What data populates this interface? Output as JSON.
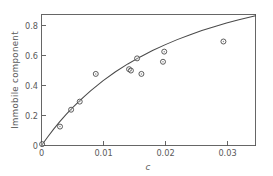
{
  "chart_data": {
    "type": "scatter",
    "title": "",
    "xlabel": "c",
    "ylabel": "Immobile component",
    "xlim": [
      0,
      0.0347
    ],
    "ylim": [
      0,
      0.97
    ],
    "grid": false,
    "legend": null,
    "x_ticks": [
      0,
      0.01,
      0.02,
      0.03
    ],
    "x_tick_labels": [
      "0",
      "0.01",
      "0.02",
      "0.03"
    ],
    "y_ticks": [
      0,
      0.2,
      0.4,
      0.6,
      0.8
    ],
    "y_tick_labels": [
      "0",
      "0.2",
      "0.4",
      "0.6",
      "0.8"
    ],
    "series": [
      {
        "name": "Immobile component data",
        "marker": "open-circle",
        "x": [
          0.0001,
          0.003,
          0.0048,
          0.0062,
          0.0088,
          0.0142,
          0.0145,
          0.0155,
          0.0162,
          0.0197,
          0.0199,
          0.0295
        ],
        "values": [
          0.01,
          0.14,
          0.265,
          0.325,
          0.53,
          0.565,
          0.555,
          0.645,
          0.53,
          0.62,
          0.695,
          0.77
        ]
      },
      {
        "name": "Fitted curve",
        "type": "line",
        "x": [
          0.0,
          0.001,
          0.002,
          0.003,
          0.004,
          0.005,
          0.006,
          0.007,
          0.008,
          0.009,
          0.01,
          0.012,
          0.014,
          0.016,
          0.018,
          0.02,
          0.022,
          0.024,
          0.026,
          0.028,
          0.03,
          0.032,
          0.0347
        ],
        "values": [
          0.0,
          0.063,
          0.123,
          0.178,
          0.23,
          0.278,
          0.323,
          0.366,
          0.406,
          0.444,
          0.48,
          0.546,
          0.604,
          0.656,
          0.703,
          0.745,
          0.784,
          0.819,
          0.851,
          0.88,
          0.907,
          0.931,
          0.96
        ]
      }
    ]
  },
  "axes": {
    "x_title": "c",
    "y_title": "Immobile component"
  }
}
